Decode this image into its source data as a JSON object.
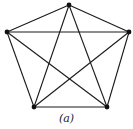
{
  "figure": {
    "caption": "(a)",
    "colors": {
      "edge": "#1a1a1a",
      "vertex": "#111111",
      "background": "#ffffff"
    },
    "vertices": [
      {
        "id": "top",
        "x": 69,
        "y": 5
      },
      {
        "id": "left",
        "x": 7,
        "y": 32
      },
      {
        "id": "right",
        "x": 129,
        "y": 32
      },
      {
        "id": "bottom-left",
        "x": 34,
        "y": 107
      },
      {
        "id": "bottom-right",
        "x": 107,
        "y": 107
      }
    ],
    "edges": [
      [
        "top",
        "left"
      ],
      [
        "top",
        "right"
      ],
      [
        "top",
        "bottom-left"
      ],
      [
        "top",
        "bottom-right"
      ],
      [
        "left",
        "right"
      ],
      [
        "left",
        "bottom-left"
      ],
      [
        "left",
        "bottom-right"
      ],
      [
        "right",
        "bottom-left"
      ],
      [
        "right",
        "bottom-right"
      ],
      [
        "bottom-left",
        "bottom-right"
      ]
    ]
  }
}
